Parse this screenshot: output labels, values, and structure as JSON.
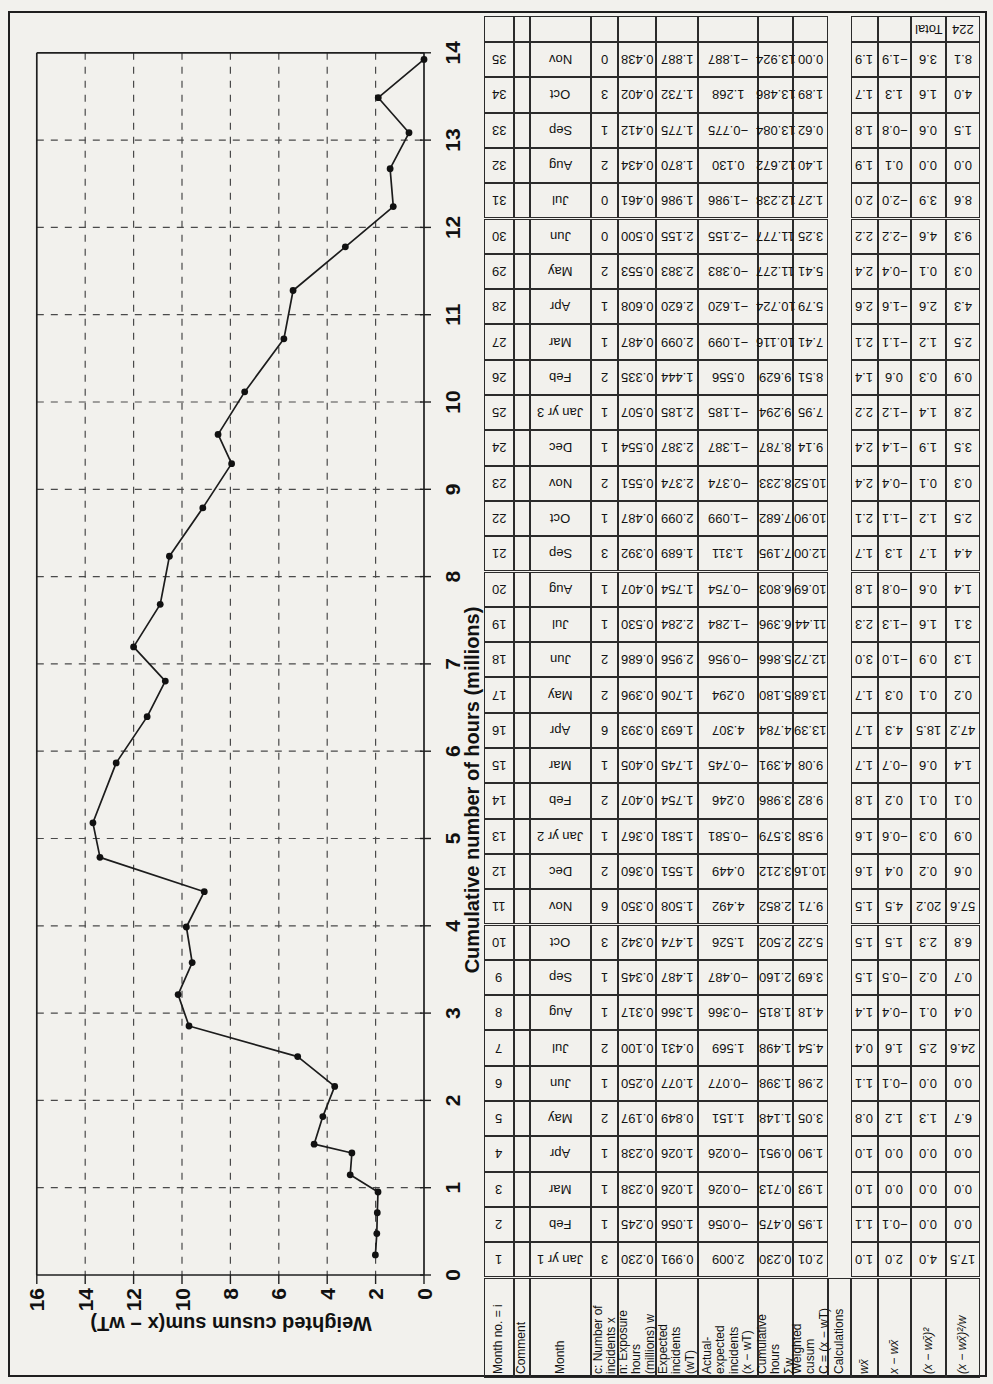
{
  "chart_data": {
    "type": "line",
    "title": "",
    "xlabel": "Cumulative number of hours (millions)",
    "ylabel": "Weighted cusum sum(x − wT)",
    "xlim": [
      0,
      14
    ],
    "ylim": [
      0,
      16
    ],
    "x_ticks": [
      0,
      1,
      2,
      3,
      4,
      5,
      6,
      7,
      8,
      9,
      10,
      11,
      12,
      13,
      14
    ],
    "y_ticks": [
      16,
      14,
      12,
      10,
      8,
      6,
      4,
      2,
      0
    ],
    "grid": "dashed gridlines at every hour (horizontal axis) and every 2 units of cusum",
    "legend": "none",
    "orientation_note": "figure printed rotated 90° on page: hours axis runs vertically, cusum axis runs along the bottom from 16 (left) to 0 (right)",
    "series": [
      {
        "name": "weighted cusum",
        "x": [
          0.23,
          0.475,
          0.713,
          0.951,
          1.148,
          1.398,
          1.498,
          1.815,
          2.16,
          2.502,
          2.852,
          3.212,
          3.579,
          3.986,
          4.391,
          4.784,
          5.18,
          5.866,
          6.396,
          6.803,
          7.195,
          7.682,
          8.233,
          8.787,
          9.294,
          9.629,
          10.116,
          10.724,
          11.277,
          11.777,
          12.238,
          12.672,
          13.084,
          13.486,
          13.924
        ],
        "y": [
          2.01,
          1.95,
          1.93,
          1.9,
          3.05,
          2.98,
          4.54,
          4.18,
          3.69,
          5.22,
          9.71,
          10.16,
          9.58,
          9.82,
          9.08,
          13.39,
          13.68,
          12.72,
          11.44,
          10.69,
          12.0,
          10.9,
          10.52,
          9.14,
          7.95,
          8.51,
          7.41,
          5.79,
          5.41,
          3.25,
          1.27,
          1.4,
          0.62,
          1.89,
          0.0
        ]
      }
    ]
  },
  "table": {
    "headers": [
      "Month no. = i",
      "Comment",
      "Month",
      "c: Number of\nincidents x",
      "n: Exposure\nhours\n(millions) w",
      "Expected\nincidents\n(wT)",
      "Actual-\nexpected\nincidents\n(x − wT)",
      "Cumulative\nhours\nΣw",
      "Weighted\ncusum\nC = (x − wT)",
      "Calculations",
      "wx̄",
      "x − wx̄",
      "(x − wx̄)²",
      "(x − wx̄)²/w"
    ],
    "total_row": {
      "label": "Total",
      "value": "224"
    },
    "rows": [
      [
        "1",
        "",
        "Jan yr 1",
        "3",
        "0.230",
        "0.991",
        "2.009",
        "0.230",
        "2.01",
        "1.0",
        "2.0",
        "4.0",
        "17.5"
      ],
      [
        "2",
        "",
        "Feb",
        "1",
        "0.245",
        "1.056",
        "−0.056",
        "0.475",
        "1.95",
        "1.1",
        "−0.1",
        "0.0",
        "0.0"
      ],
      [
        "3",
        "",
        "Mar",
        "1",
        "0.238",
        "1.026",
        "−0.026",
        "0.713",
        "1.93",
        "1.0",
        "0.0",
        "0.0",
        "0.0"
      ],
      [
        "4",
        "",
        "Apr",
        "1",
        "0.238",
        "1.026",
        "−0.026",
        "0.951",
        "1.90",
        "1.0",
        "0.0",
        "0.0",
        "0.0"
      ],
      [
        "5",
        "",
        "May",
        "2",
        "0.197",
        "0.849",
        "1.151",
        "1.148",
        "3.05",
        "0.8",
        "1.2",
        "1.3",
        "6.7"
      ],
      [
        "6",
        "",
        "Jun",
        "1",
        "0.250",
        "1.077",
        "−0.077",
        "1.398",
        "2.98",
        "1.1",
        "−0.1",
        "0.0",
        "0.0"
      ],
      [
        "7",
        "",
        "Jul",
        "2",
        "0.100",
        "0.431",
        "1.569",
        "1.498",
        "4.54",
        "0.4",
        "1.6",
        "2.5",
        "24.6"
      ],
      [
        "8",
        "",
        "Aug",
        "1",
        "0.317",
        "1.366",
        "−0.366",
        "1.815",
        "4.18",
        "1.4",
        "−0.4",
        "0.1",
        "0.4"
      ],
      [
        "9",
        "",
        "Sep",
        "1",
        "0.345",
        "1.487",
        "−0.487",
        "2.160",
        "3.69",
        "1.5",
        "−0.5",
        "0.2",
        "0.7"
      ],
      [
        "10",
        "",
        "Oct",
        "3",
        "0.342",
        "1.474",
        "1.526",
        "2.502",
        "5.22",
        "1.5",
        "1.5",
        "2.3",
        "6.8"
      ],
      [
        "11",
        "",
        "Nov",
        "6",
        "0.350",
        "1.508",
        "4.492",
        "2.852",
        "9.71",
        "1.5",
        "4.5",
        "20.2",
        "57.6"
      ],
      [
        "12",
        "",
        "Dec",
        "2",
        "0.360",
        "1.551",
        "0.449",
        "3.212",
        "10.16",
        "1.6",
        "0.4",
        "0.2",
        "0.6"
      ],
      [
        "13",
        "",
        "Jan yr 2",
        "1",
        "0.367",
        "1.581",
        "−0.581",
        "3.579",
        "9.58",
        "1.6",
        "−0.6",
        "0.3",
        "0.9"
      ],
      [
        "14",
        "",
        "Feb",
        "2",
        "0.407",
        "1.754",
        "0.246",
        "3.986",
        "9.82",
        "1.8",
        "0.2",
        "0.1",
        "0.1"
      ],
      [
        "15",
        "",
        "Mar",
        "1",
        "0.405",
        "1.745",
        "−0.745",
        "4.391",
        "9.08",
        "1.7",
        "−0.7",
        "0.6",
        "1.4"
      ],
      [
        "16",
        "",
        "Apr",
        "6",
        "0.393",
        "1.693",
        "4.307",
        "4.784",
        "13.39",
        "1.7",
        "4.3",
        "18.5",
        "47.2"
      ],
      [
        "17",
        "",
        "May",
        "2",
        "0.396",
        "1.706",
        "0.294",
        "5.180",
        "13.68",
        "1.7",
        "0.3",
        "0.1",
        "0.2"
      ],
      [
        "18",
        "",
        "Jun",
        "2",
        "0.686",
        "2.956",
        "−0.956",
        "5.866",
        "12.72",
        "3.0",
        "−1.0",
        "0.9",
        "1.3"
      ],
      [
        "19",
        "",
        "Jul",
        "1",
        "0.530",
        "2.284",
        "−1.284",
        "6.396",
        "11.44",
        "2.3",
        "−1.3",
        "1.6",
        "3.1"
      ],
      [
        "20",
        "",
        "Aug",
        "1",
        "0.407",
        "1.754",
        "−0.754",
        "6.803",
        "10.69",
        "1.8",
        "−0.8",
        "0.6",
        "1.4"
      ],
      [
        "21",
        "",
        "Sep",
        "3",
        "0.392",
        "1.689",
        "1.311",
        "7.195",
        "12.00",
        "1.7",
        "1.3",
        "1.7",
        "4.4"
      ],
      [
        "22",
        "",
        "Oct",
        "1",
        "0.487",
        "2.099",
        "−1.099",
        "7.682",
        "10.90",
        "2.1",
        "−1.1",
        "1.2",
        "2.5"
      ],
      [
        "23",
        "",
        "Nov",
        "2",
        "0.551",
        "2.374",
        "−0.374",
        "8.233",
        "10.52",
        "2.4",
        "−0.4",
        "0.1",
        "0.3"
      ],
      [
        "24",
        "",
        "Dec",
        "1",
        "0.554",
        "2.387",
        "−1.387",
        "8.787",
        "9.14",
        "2.4",
        "−1.4",
        "1.9",
        "3.5"
      ],
      [
        "25",
        "",
        "Jan yr 3",
        "1",
        "0.507",
        "2.185",
        "−1.185",
        "9.294",
        "7.95",
        "2.2",
        "−1.2",
        "1.4",
        "2.8"
      ],
      [
        "26",
        "",
        "Feb",
        "2",
        "0.335",
        "1.444",
        "0.556",
        "9.629",
        "8.51",
        "1.4",
        "0.6",
        "0.3",
        "0.9"
      ],
      [
        "27",
        "",
        "Mar",
        "1",
        "0.487",
        "2.099",
        "−1.099",
        "10.116",
        "7.41",
        "2.1",
        "−1.1",
        "1.2",
        "2.5"
      ],
      [
        "28",
        "",
        "Apr",
        "1",
        "0.608",
        "2.620",
        "−1.620",
        "10.724",
        "5.79",
        "2.6",
        "−1.6",
        "2.6",
        "4.3"
      ],
      [
        "29",
        "",
        "May",
        "2",
        "0.553",
        "2.383",
        "−0.383",
        "11.277",
        "5.41",
        "2.4",
        "−0.4",
        "0.1",
        "0.3"
      ],
      [
        "30",
        "",
        "Jun",
        "0",
        "0.500",
        "2.155",
        "−2.155",
        "11.777",
        "3.25",
        "2.2",
        "−2.2",
        "4.6",
        "9.3"
      ],
      [
        "31",
        "",
        "Jul",
        "0",
        "0.461",
        "1.986",
        "−1.986",
        "12.238",
        "1.27",
        "2.0",
        "−2.0",
        "3.9",
        "8.6"
      ],
      [
        "32",
        "",
        "Aug",
        "2",
        "0.434",
        "1.870",
        "0.130",
        "12.672",
        "1.40",
        "1.9",
        "0.1",
        "0.0",
        "0.0"
      ],
      [
        "33",
        "",
        "Sep",
        "1",
        "0.412",
        "1.775",
        "−0.775",
        "13.084",
        "0.62",
        "1.8",
        "−0.8",
        "0.6",
        "1.5"
      ],
      [
        "34",
        "",
        "Oct",
        "3",
        "0.402",
        "1.732",
        "1.268",
        "13.486",
        "1.89",
        "1.7",
        "1.3",
        "1.6",
        "4.0"
      ],
      [
        "35",
        "",
        "Nov",
        "0",
        "0.438",
        "1.887",
        "−1.887",
        "13.924",
        "0.00",
        "1.9",
        "−1.9",
        "3.6",
        "8.1"
      ]
    ]
  }
}
